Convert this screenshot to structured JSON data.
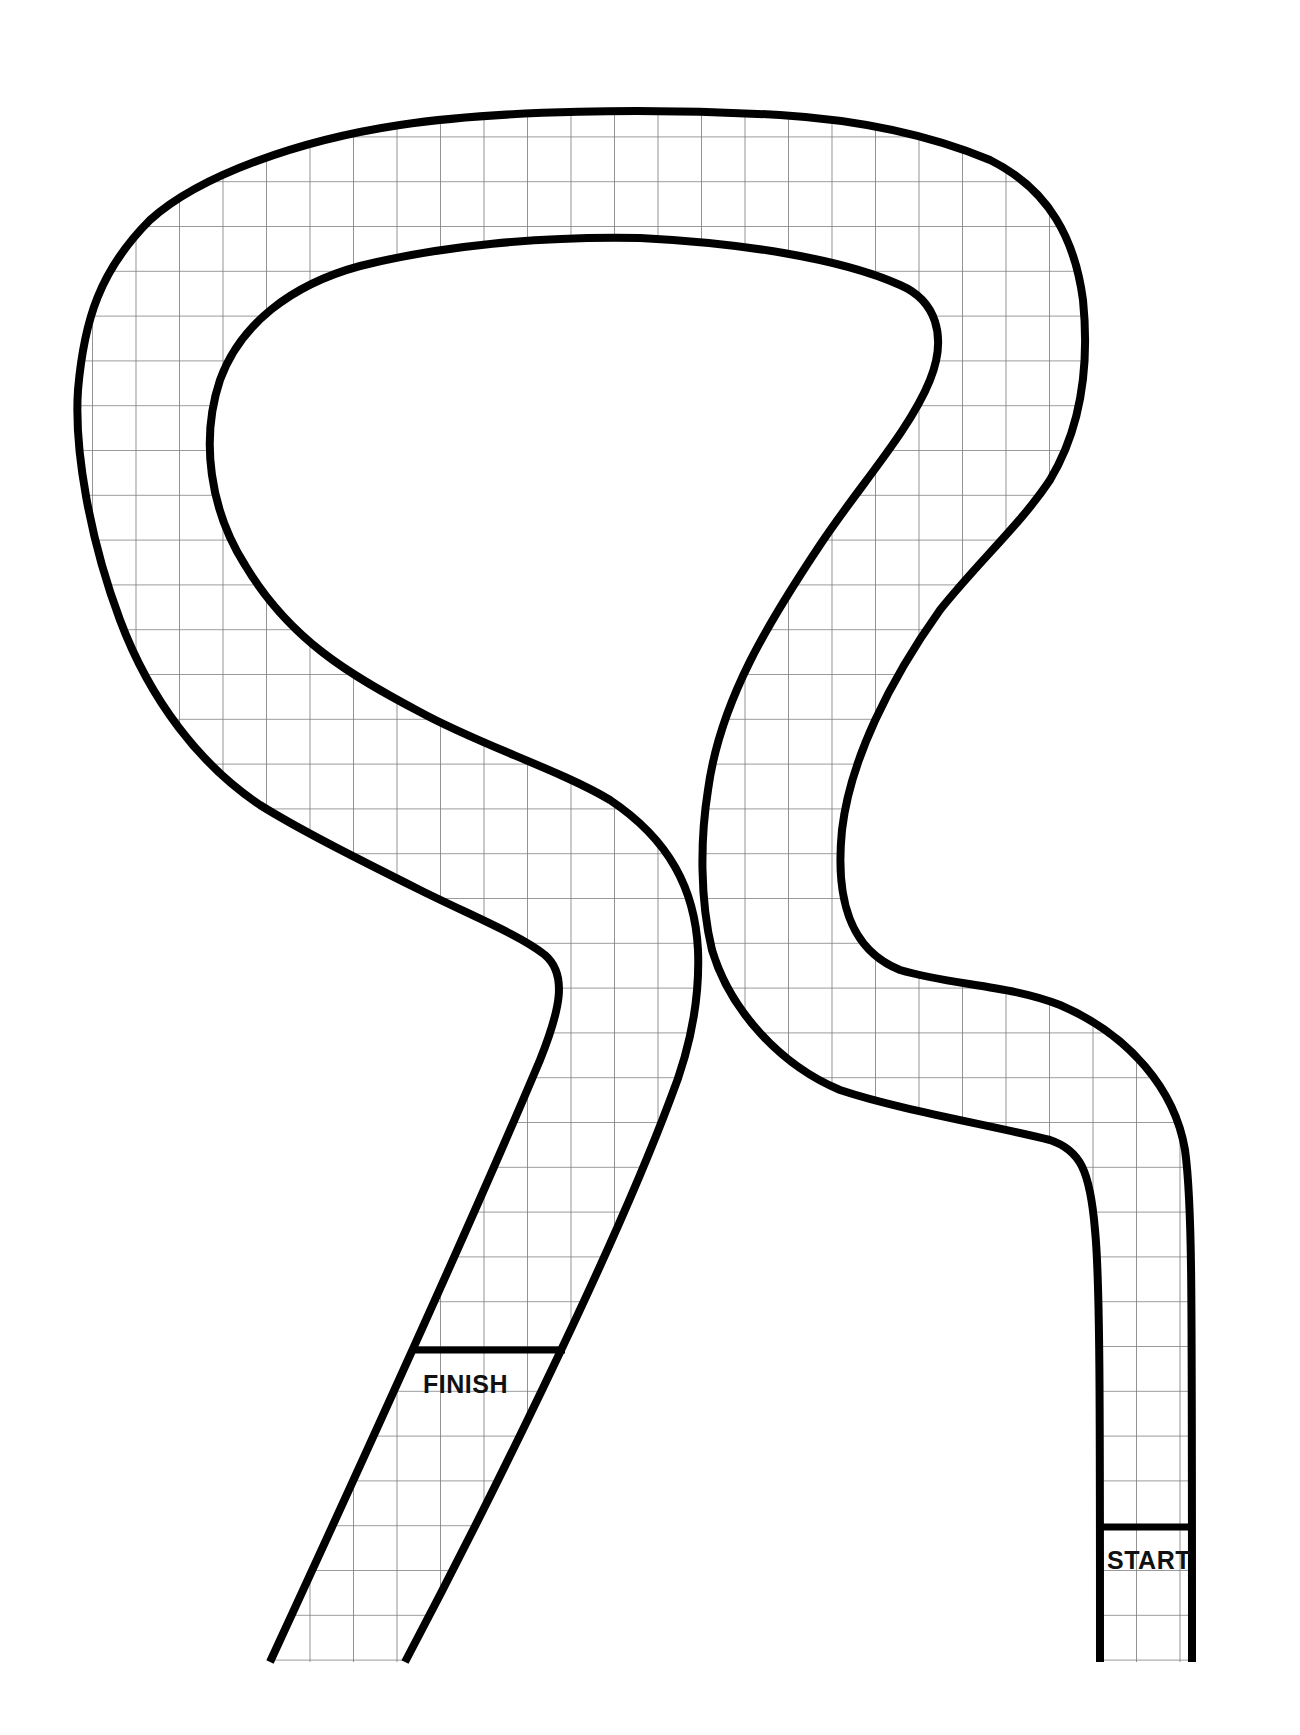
{
  "game": {
    "title": "Race track board",
    "finish_label": "FINISH",
    "start_label": "START"
  },
  "style": {
    "track_line_color": "#000000",
    "grid_line_color": "#777777",
    "background": "#ffffff"
  }
}
